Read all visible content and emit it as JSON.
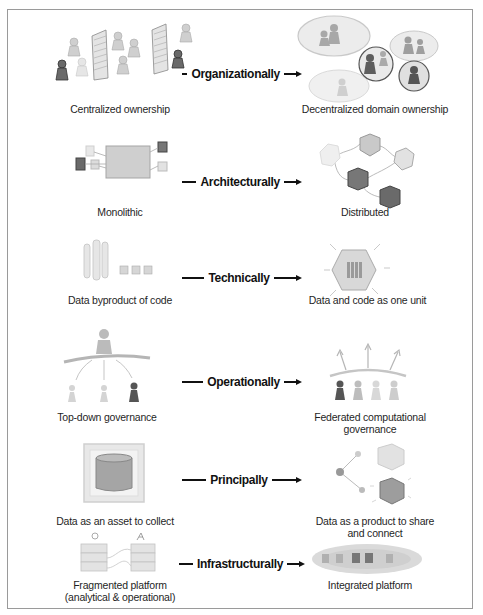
{
  "figure": {
    "rows": [
      {
        "dimension": "Organizationally",
        "from": {
          "label": "Centralized ownership",
          "icon": "centralized-people-icon"
        },
        "to": {
          "label": "Decentralized domain ownership",
          "icon": "domain-bubbles-icon"
        }
      },
      {
        "dimension": "Architecturally",
        "from": {
          "label": "Monolithic",
          "icon": "monolith-block-icon"
        },
        "to": {
          "label": "Distributed",
          "icon": "hexagon-network-icon"
        }
      },
      {
        "dimension": "Technically",
        "from": {
          "label": "Data byproduct of code",
          "icon": "code-pipes-icon"
        },
        "to": {
          "label": "Data and code as one unit",
          "icon": "hexagon-unit-icon"
        }
      },
      {
        "dimension": "Operationally",
        "from": {
          "label": "Top-down governance",
          "icon": "top-down-hierarchy-icon"
        },
        "to": {
          "label": "Federated computational",
          "label2": "governance",
          "icon": "federated-people-icon"
        }
      },
      {
        "dimension": "Principally",
        "from": {
          "label": "Data as an asset to collect",
          "icon": "data-barrel-icon"
        },
        "to": {
          "label": "Data as a product to share",
          "label2": "and connect",
          "icon": "data-product-icon"
        }
      },
      {
        "dimension": "Infrastructurally",
        "from": {
          "label": "Fragmented platform",
          "label2": "(analytical & operational)",
          "icon": "fragmented-stacks-icon"
        },
        "to": {
          "label": "Integrated platform",
          "icon": "integrated-cloud-icon"
        }
      }
    ]
  },
  "colors": {
    "frame": "#9a9a9a",
    "text": "#1f1f1f",
    "sketch_light": "#d6d6d6",
    "sketch_mid": "#9f9f9f",
    "sketch_dark": "#5a5a5a"
  }
}
